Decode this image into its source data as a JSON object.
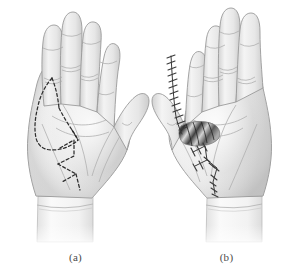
{
  "figure": {
    "background_color": "#ffffff",
    "width": 302,
    "height": 278,
    "style": "grayscale medical line illustration",
    "caption_color": "#4a4a4a"
  },
  "panels": [
    {
      "id": "a",
      "label": "(a)",
      "subject": "left palm, volar view",
      "description": "hand with dashed Brunner zigzag surgical incision planning lines drawn on the thumb web, thenar eminence and central palm",
      "marking_type": "dashed planning incision",
      "marking_color": "#2e2e2e",
      "skin_color": "#ededed",
      "skin_shadow_color": "#bfbfbf",
      "outline_color": "#8c8c8c",
      "crease_color": "#a9a9a9",
      "cuff_color": "#f4f4f4"
    },
    {
      "id": "b",
      "label": "(b)",
      "subject": "left palm, volar view",
      "description": "hand after operation showing sutured closure along the index finger and palm with an open window exposing underlying tendon and fascia",
      "marking_type": "suture line",
      "marking_color": "#3a3a3a",
      "skin_color": "#ededed",
      "skin_shadow_color": "#bfbfbf",
      "outline_color": "#8c8c8c",
      "crease_color": "#a9a9a9",
      "cuff_color": "#f4f4f4",
      "exposed_tissue_colors": [
        "#5a5a5a",
        "#2f2f2f",
        "#9a9a9a",
        "#d9d9d9"
      ]
    }
  ],
  "colors": {
    "white": "#ffffff",
    "skin_light": "#f3f3f3",
    "skin_mid": "#e4e4e4",
    "skin_dark": "#c6c6c6",
    "line_dark": "#2e2e2e",
    "line_mid": "#8c8c8c"
  }
}
